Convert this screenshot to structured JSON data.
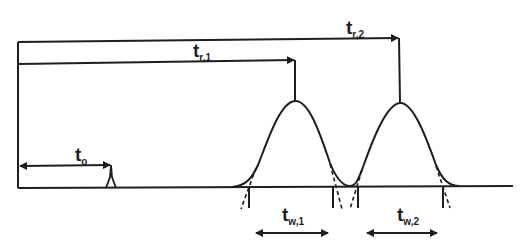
{
  "colors": {
    "ink": "#1e1e1e",
    "background": "#ffffff"
  },
  "labels": {
    "t0": {
      "main": "t",
      "sub": "o"
    },
    "tr1": {
      "main": "t",
      "sub": "r,1"
    },
    "tr2": {
      "main": "t",
      "sub": "r,2"
    },
    "tw1": {
      "main": "t",
      "sub": "w,1"
    },
    "tw2": {
      "main": "t",
      "sub": "w,2"
    }
  },
  "elements": {
    "baseline": "baseline",
    "dead_time_peak": "unretained peak (t0)",
    "peak1": "peak 1",
    "peak2": "peak 2",
    "tangent_lines": "tangent extrapolations (dashed)"
  }
}
